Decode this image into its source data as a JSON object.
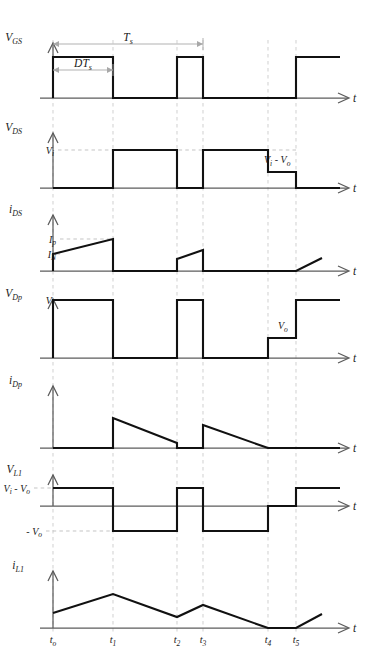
{
  "figure": {
    "axis_label_t": "t",
    "time_markers": [
      {
        "name": "t_o",
        "label": "t",
        "sub": "o",
        "x": 53
      },
      {
        "name": "t_1",
        "label": "t",
        "sub": "1",
        "x": 113
      },
      {
        "name": "t_2",
        "label": "t",
        "sub": "2",
        "x": 177
      },
      {
        "name": "t_3",
        "label": "t",
        "sub": "3",
        "x": 203
      },
      {
        "name": "t_4",
        "label": "t",
        "sub": "4",
        "x": 268
      },
      {
        "name": "t_5",
        "label": "t",
        "sub": "5",
        "x": 296
      }
    ],
    "dimensions": [
      {
        "name": "switching-period",
        "label": "T",
        "sub": "s",
        "from_x": 53,
        "to_x": 203,
        "y": 44
      },
      {
        "name": "on-time",
        "label": "DT",
        "sub": "s",
        "from_x": 53,
        "to_x": 113,
        "y": 70
      }
    ],
    "panels": [
      {
        "name": "vgs",
        "label": "V",
        "sub": "GS",
        "baseline_y": 98,
        "label_x": 22,
        "label_y": 41,
        "levels": [],
        "annotations": [],
        "path": "M53,98 L53,57 L113,57 L113,98 L177,98 L177,57 L203,57 L203,98 L296,98 L296,57 L340,57"
      },
      {
        "name": "vds",
        "label": "V",
        "sub": "DS",
        "baseline_y": 188,
        "label_x": 22,
        "label_y": 131,
        "levels": [
          {
            "name": "vi",
            "label": "V",
            "sub": "i",
            "y": 150,
            "x": 40,
            "dash_to": 296
          }
        ],
        "annotations": [
          {
            "name": "vi-minus-vo",
            "label": "V",
            "sub": "i",
            "label2": "- V",
            "sub2": "o",
            "x": 264,
            "y": 163
          }
        ],
        "path": "M53,188 L113,188 L113,150 L177,150 L177,188 L203,188 L203,150 L268,150 L268,172 L296,172 L296,188 L340,188"
      },
      {
        "name": "ids",
        "label": "i",
        "sub": "DS",
        "baseline_y": 271,
        "label_x": 22,
        "label_y": 213,
        "levels": [
          {
            "name": "ip",
            "label": "I",
            "sub": "p",
            "y": 239,
            "x": 42,
            "dash_to": 113
          },
          {
            "name": "in",
            "label": "I",
            "sub": "N",
            "y": 254,
            "x": 42,
            "dash_to": 53
          }
        ],
        "annotations": [],
        "path": "M53,271 L53,254 L113,239 L113,271 L177,271 L177,259 L203,250 L203,271 L296,271 L322,258"
      },
      {
        "name": "vdp",
        "label": "V",
        "sub": "Dp",
        "baseline_y": 358,
        "label_x": 22,
        "label_y": 297,
        "levels": [
          {
            "name": "vi",
            "label": "V",
            "sub": "i",
            "y": 300,
            "x": 40,
            "dash_to": 53
          }
        ],
        "annotations": [
          {
            "name": "vo-level",
            "label": "V",
            "sub": "o",
            "x": 278,
            "y": 329
          }
        ],
        "path": "M53,358 L53,300 L113,300 L113,358 L177,358 L177,300 L203,300 L203,358 L268,358 L268,338 L296,338 L296,300 L340,300"
      },
      {
        "name": "idp",
        "label": "i",
        "sub": "Dp",
        "baseline_y": 448,
        "label_x": 22,
        "label_y": 384,
        "levels": [],
        "annotations": [],
        "path": "M53,448 L113,448 L113,418 L177,443 L177,448 L203,448 L203,425 L268,448 L340,448"
      },
      {
        "name": "vl1",
        "label": "V",
        "sub": "L1",
        "baseline_y": 506,
        "label_x": 22,
        "label_y": 473,
        "levels": [
          {
            "name": "vi-minus-vo",
            "label": "V",
            "sub": "i",
            "label2": "- V",
            "sub2": "o",
            "y": 488,
            "x": 16,
            "dash_to": 53
          },
          {
            "name": "minus-vo",
            "label": "- V",
            "sub": "o",
            "y": 531,
            "x": 28,
            "dash_to": 113
          }
        ],
        "annotations": [],
        "path": "M53,488 L113,488 L113,531 L177,531 L177,488 L203,488 L203,531 L268,531 L268,506 L296,506 L296,488 L340,488"
      },
      {
        "name": "il1",
        "label": "i",
        "sub": "L1",
        "baseline_y": 628,
        "label_x": 24,
        "label_y": 569,
        "levels": [],
        "annotations": [],
        "path": "M53,613 L113,594 L177,617 L203,605 L268,628 L296,628 L322,614"
      }
    ]
  }
}
